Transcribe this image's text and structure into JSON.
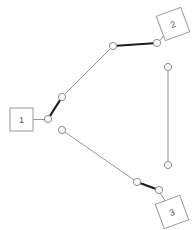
{
  "canvas": {
    "width": 196,
    "height": 230,
    "background": "#ffffff"
  },
  "style": {
    "line_color": "#8a8a8a",
    "highlight_color": "#1c1c1c",
    "node_stroke": "#8a8a8a",
    "node_fill": "#ffffff",
    "label_box_stroke": "#9a9a9a",
    "label_box_fill": "#ffffff",
    "label_text_color": "#555555"
  },
  "labels": [
    {
      "id": "label-1",
      "text": "1",
      "shape": "square",
      "cx": 21.5,
      "cy": 119.5,
      "size": 23,
      "rotation": 0,
      "leader_to_x": 45,
      "leader_to_y": 119.5
    },
    {
      "id": "label-2",
      "text": "2",
      "shape": "square",
      "cx": 173,
      "cy": 24,
      "size": 26,
      "rotation": -20,
      "leader_to_x": 158,
      "leader_to_y": 43
    },
    {
      "id": "label-3",
      "text": "3",
      "shape": "square",
      "cx": 172,
      "cy": 212,
      "size": 26,
      "rotation": -20,
      "leader_to_x": 159,
      "leader_to_y": 191
    }
  ],
  "nodes": [
    {
      "id": "n1",
      "cx": 48,
      "cy": 119,
      "r": 3.6
    },
    {
      "id": "n2",
      "cx": 62,
      "cy": 97,
      "r": 3.6
    },
    {
      "id": "n3",
      "cx": 113,
      "cy": 46,
      "r": 3.6
    },
    {
      "id": "n4",
      "cx": 157,
      "cy": 43,
      "r": 3.6
    },
    {
      "id": "n5",
      "cx": 168,
      "cy": 67,
      "r": 3.6
    },
    {
      "id": "n6",
      "cx": 168,
      "cy": 165,
      "r": 3.6
    },
    {
      "id": "n7",
      "cx": 62,
      "cy": 130,
      "r": 3.6
    },
    {
      "id": "n8",
      "cx": 137,
      "cy": 182,
      "r": 3.6
    },
    {
      "id": "n9",
      "cx": 159,
      "cy": 190,
      "r": 3.6
    }
  ],
  "edges": [
    {
      "id": "e1",
      "from": "n2",
      "to": "n3",
      "weight": "thin"
    },
    {
      "id": "e2",
      "from": "n3",
      "to": "n4",
      "weight": "thick"
    },
    {
      "id": "e3",
      "from": "n1",
      "to": "n2",
      "weight": "thick"
    },
    {
      "id": "e4",
      "from": "n5",
      "to": "n6",
      "weight": "thin"
    },
    {
      "id": "e5",
      "from": "n7",
      "to": "n8",
      "weight": "thin"
    },
    {
      "id": "e6",
      "from": "n8",
      "to": "n9",
      "weight": "thick"
    }
  ]
}
